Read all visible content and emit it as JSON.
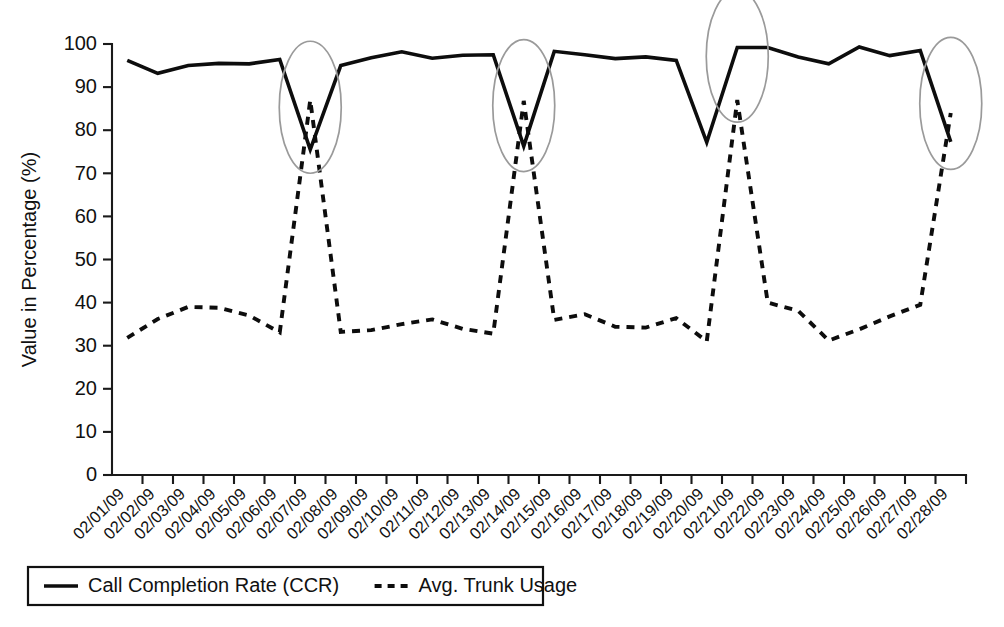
{
  "chart_data": {
    "type": "line",
    "title": "",
    "xlabel": "",
    "ylabel": "Value in Percentage (%)",
    "ylim": [
      0,
      100
    ],
    "ytick_step": 10,
    "yticks": [
      "0",
      "10",
      "20",
      "30",
      "40",
      "50",
      "60",
      "70",
      "80",
      "90",
      "100"
    ],
    "grid": false,
    "legend_position": "bottom-left",
    "categories": [
      "02/01/09",
      "02/02/09",
      "02/03/09",
      "02/04/09",
      "02/05/09",
      "02/06/09",
      "02/07/09",
      "02/08/09",
      "02/09/09",
      "02/10/09",
      "02/11/09",
      "02/12/09",
      "02/13/09",
      "02/14/09",
      "02/15/09",
      "02/16/09",
      "02/17/09",
      "02/18/09",
      "02/19/09",
      "02/20/09",
      "02/21/09",
      "02/22/09",
      "02/23/09",
      "02/24/09",
      "02/25/09",
      "02/26/09",
      "02/27/09",
      "02/28/09"
    ],
    "series": [
      {
        "name": "Call Completion Rate (CCR)",
        "style": "solid",
        "color": "#0d0d0d",
        "values": [
          96.2,
          93.2,
          95.0,
          95.5,
          95.4,
          96.4,
          75.5,
          95.0,
          96.8,
          98.2,
          96.7,
          97.4,
          97.5,
          76.3,
          98.3,
          97.5,
          96.6,
          97.0,
          96.2,
          77.2,
          99.2,
          99.2,
          97.0,
          95.4,
          99.3,
          97.3,
          98.5,
          77.3
        ]
      },
      {
        "name": "Avg. Trunk Usage",
        "style": "dashed",
        "color": "#0d0d0d",
        "values": [
          31.8,
          36.2,
          39.0,
          38.8,
          37.0,
          33.1,
          87.0,
          33.2,
          33.6,
          35.0,
          36.1,
          33.9,
          32.8,
          86.8,
          36.0,
          37.3,
          34.4,
          34.2,
          36.4,
          31.0,
          87.0,
          40.0,
          38.1,
          31.2,
          33.8,
          36.8,
          39.5,
          84.0
        ]
      }
    ],
    "annotations": {
      "type": "ellipse-highlight",
      "color": "#9a9a9a",
      "label": "anomaly-highlight",
      "at_categories": [
        "02/07/09",
        "02/14/09",
        "02/21/09",
        "02/28/09"
      ]
    }
  },
  "legend": {
    "items": [
      {
        "label": "Call Completion Rate (CCR)",
        "style": "solid"
      },
      {
        "label": "Avg. Trunk Usage",
        "style": "dashed"
      }
    ]
  }
}
